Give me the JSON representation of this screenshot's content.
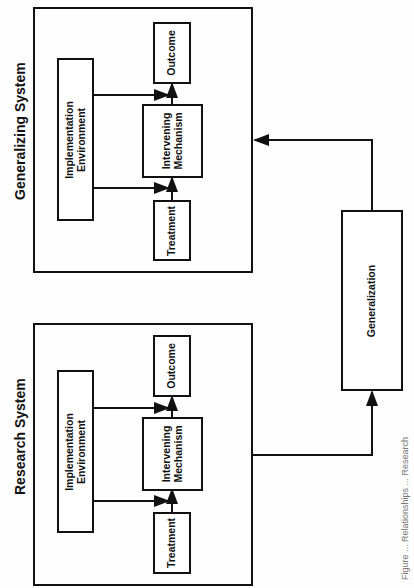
{
  "diagram": {
    "generalizing_system": {
      "title": "Generalizing System",
      "implementation_environment": "Implementation Environment",
      "implementation_line1": "Implementation",
      "implementation_line2": "Environment",
      "outcome": "Outcome",
      "intervening_line1": "Intervening",
      "intervening_line2": "Mechanism",
      "treatment": "Treatment"
    },
    "research_system": {
      "title": "Research System",
      "implementation_line1": "Implementation",
      "implementation_line2": "Environment",
      "outcome": "Outcome",
      "intervening_line1": "Intervening",
      "intervening_line2": "Mechanism",
      "treatment": "Treatment"
    },
    "generalization": "Generalization",
    "caption": "Figure ... Relationships ... Research"
  }
}
